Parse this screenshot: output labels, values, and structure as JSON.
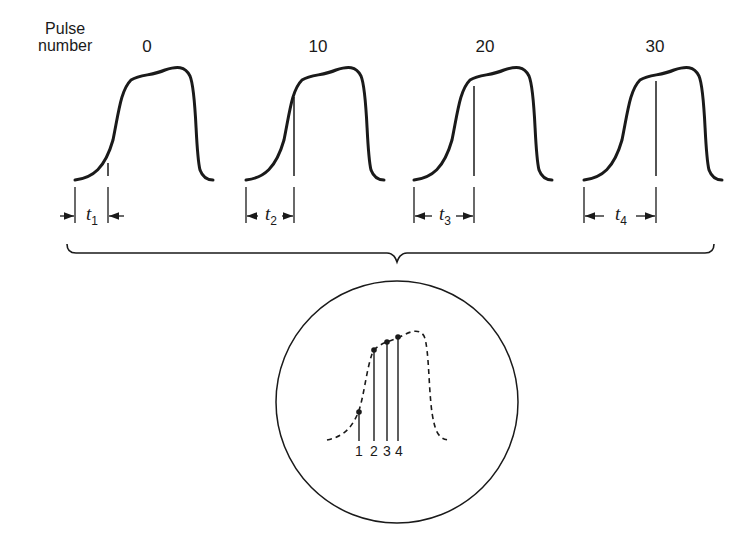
{
  "diagram": {
    "axis_label": {
      "line1": "Pulse",
      "line2": "number"
    },
    "pulses": [
      {
        "number": "0",
        "cx": 147,
        "marker_x": 108,
        "t_label": "t",
        "t_sub": "1"
      },
      {
        "number": "10",
        "cx": 318,
        "marker_x": 294,
        "t_label": "t",
        "t_sub": "2"
      },
      {
        "number": "20",
        "cx": 485,
        "marker_x": 474,
        "t_label": "t",
        "t_sub": "3"
      },
      {
        "number": "30",
        "cx": 655,
        "marker_x": 656,
        "t_label": "t",
        "t_sub": "4"
      }
    ],
    "composite": {
      "description": "Sampled points from successive pulses reconstruct the waveform (dashed) on the display",
      "markers": [
        "1",
        "2",
        "3",
        "4"
      ]
    },
    "colors": {
      "ink": "#1a1a1a",
      "background": "#ffffff"
    }
  }
}
